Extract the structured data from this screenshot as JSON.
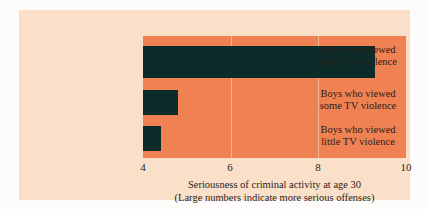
{
  "chart_data": {
    "type": "bar",
    "orientation": "horizontal",
    "title": "",
    "categories": [
      "Boys who viewed much TV violence",
      "Boys who viewed some TV violence",
      "Boys who viewed little TV violence"
    ],
    "category_lines": [
      [
        "Boys who viewed",
        "much TV violence"
      ],
      [
        "Boys who viewed",
        "some TV violence"
      ],
      [
        "Boys who viewed",
        "little TV violence"
      ]
    ],
    "values": [
      9.3,
      4.8,
      4.4
    ],
    "xlabel": "Seriousness of criminal activity at age 30",
    "xlabel_note": "(Large numbers indicate more serious offenses)",
    "ylabel": "",
    "xlim": [
      4,
      10
    ],
    "xticks": [
      4,
      6,
      8,
      10
    ],
    "xtick_labels": [
      "4",
      "6",
      "8",
      "10"
    ],
    "grid": true,
    "grid_axis": "x",
    "legend": false,
    "colors": {
      "bar": "#0d2b28",
      "plot_background": "#ef8153",
      "page_background": "#fae0c8",
      "gridline": "#f7b491",
      "text": "#2a2119"
    }
  }
}
